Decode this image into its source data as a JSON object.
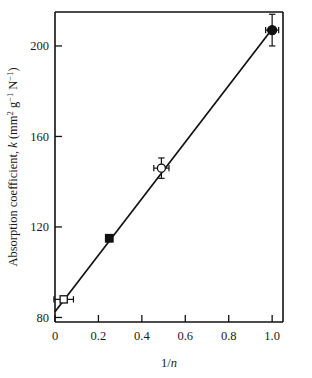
{
  "chart_data": {
    "type": "scatter",
    "title": "",
    "subtitle": "",
    "xlabel": "1/n",
    "xlabel_parts": {
      "prefix": "1/",
      "italic": "n"
    },
    "ylabel": "Absorption coefficient, k (mm2 g-1 N-1)",
    "ylabel_parts": {
      "lead": "Absorption coefficient, ",
      "symbol": "k",
      "unit_open": " (mm",
      "unit_exp1": "2",
      "unit_mid1": " g",
      "unit_exp2": "−1",
      "unit_mid2": " N",
      "unit_exp3": "−1",
      "unit_close": ")"
    },
    "xlim": [
      0,
      1.05
    ],
    "ylim": [
      78,
      215
    ],
    "xticks": [
      0,
      0.2,
      0.4,
      0.6,
      0.8,
      1.0
    ],
    "xticklabels": [
      "0",
      "0.2",
      "0.4",
      "0.6",
      "0.8",
      "1.0"
    ],
    "yticks": [
      80,
      120,
      160,
      200
    ],
    "yticklabels": [
      "80",
      "120",
      "160",
      "200"
    ],
    "grid": false,
    "legend": "none",
    "axis_color": "#111111",
    "points": [
      {
        "name": "open-square",
        "marker": "open-square",
        "x": 0.04,
        "y": 88,
        "xerr": 0.045,
        "yerr": 0
      },
      {
        "name": "filled-square",
        "marker": "filled-square",
        "x": 0.25,
        "y": 115,
        "xerr": 0,
        "yerr": 0
      },
      {
        "name": "open-circle",
        "marker": "open-circle",
        "x": 0.49,
        "y": 146,
        "xerr": 0.035,
        "yerr": 4.5
      },
      {
        "name": "filled-circle",
        "marker": "filled-circle",
        "x": 1.0,
        "y": 207,
        "xerr": 0.03,
        "yerr": 7
      }
    ],
    "fit_line": {
      "x0": 0.0,
      "y0": 82.5,
      "x1": 1.0,
      "y1": 207.5
    }
  }
}
